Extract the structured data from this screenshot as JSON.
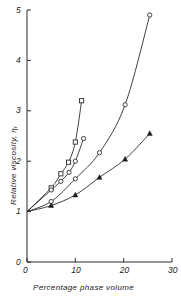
{
  "chart_data": {
    "type": "line",
    "title": "",
    "subtitle": "",
    "xlabel": "Percentage phase volume",
    "ylabel": "Relative viscosity,",
    "ylabel_symbol": "η",
    "ylabel_subscript": "r",
    "xlim": [
      0,
      30
    ],
    "ylim": [
      0,
      5
    ],
    "xticks": [
      0,
      10,
      20,
      30
    ],
    "yticks": [
      0,
      1,
      2,
      3,
      4,
      5
    ],
    "xtick_labels": [
      "0",
      "10",
      "20",
      "30"
    ],
    "ytick_labels": [
      "0",
      "1",
      "2",
      "3",
      "4",
      "5"
    ],
    "grid": false,
    "legend": "none",
    "series": [
      {
        "name": "series-1",
        "marker": "open-square",
        "x": [
          0,
          5,
          7,
          8.6,
          10,
          11.3
        ],
        "y": [
          1.0,
          1.47,
          1.75,
          1.98,
          2.38,
          3.2
        ]
      },
      {
        "name": "series-2",
        "marker": "open-circle",
        "x": [
          0,
          5,
          7,
          8.7,
          10,
          11.7
        ],
        "y": [
          1.0,
          1.43,
          1.6,
          1.78,
          2.0,
          2.45
        ]
      },
      {
        "name": "series-3",
        "marker": "open-circle",
        "x": [
          0,
          5,
          10,
          15,
          20.3,
          25.4
        ],
        "y": [
          1.0,
          1.2,
          1.65,
          2.17,
          3.12,
          4.9
        ]
      },
      {
        "name": "series-4",
        "marker": "filled-triangle",
        "x": [
          0,
          5,
          10,
          15,
          20.3,
          25.4
        ],
        "y": [
          1.0,
          1.12,
          1.33,
          1.68,
          2.04,
          2.55
        ]
      }
    ]
  },
  "axes": {
    "x_axis_name": "x-axis",
    "y_axis_name": "y-axis"
  }
}
